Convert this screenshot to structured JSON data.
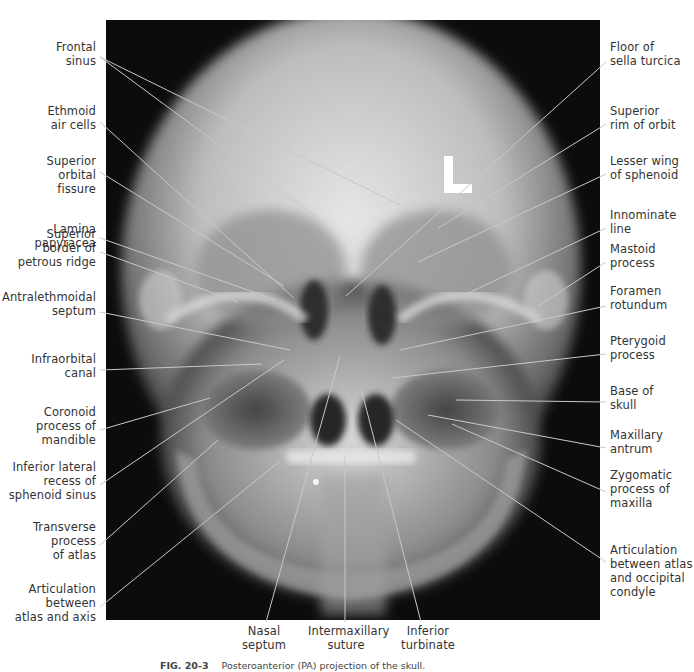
{
  "figure": {
    "modality": "PA radiograph of skull",
    "marker": "L",
    "caption_label": "FIG. 20-3",
    "caption_text": "Posteroanterior (PA) projection of the skull."
  },
  "labels_left": [
    {
      "id": "frontal-sinus",
      "lines": [
        "Frontal",
        "sinus"
      ],
      "top": 40,
      "anchor": [
        100,
        57
      ],
      "target": [
        318,
        218
      ],
      "target2": [
        400,
        205
      ]
    },
    {
      "id": "ethmoid-air-cells",
      "lines": [
        "Ethmoid",
        "air cells"
      ],
      "top": 104,
      "anchor": [
        100,
        122
      ],
      "target": [
        294,
        298
      ]
    },
    {
      "id": "superior-orbital-fissure",
      "lines": [
        "Superior",
        "orbital",
        "fissure"
      ],
      "top": 154,
      "anchor": [
        100,
        172
      ],
      "target": [
        284,
        286
      ]
    },
    {
      "id": "lamina-papyracea",
      "lines": [
        "Lamina",
        "papyracea"
      ],
      "top": 222,
      "anchor": [
        100,
        238
      ],
      "target": [
        276,
        300
      ]
    },
    {
      "id": "superior-border-petrous-ridge",
      "lines": [
        "Superior",
        "border of",
        "petrous ridge"
      ],
      "top": 227,
      "anchor": [
        100,
        252
      ],
      "target": [
        238,
        302
      ]
    },
    {
      "id": "antralethmoidal-septum",
      "lines": [
        "Antralethmoidal",
        "septum"
      ],
      "top": 290,
      "anchor": [
        100,
        312
      ],
      "target": [
        290,
        350
      ]
    },
    {
      "id": "infraorbital-canal",
      "lines": [
        "Infraorbital",
        "canal"
      ],
      "top": 352,
      "anchor": [
        100,
        370
      ],
      "target": [
        262,
        364
      ]
    },
    {
      "id": "coronoid-process-mandible",
      "lines": [
        "Coronoid",
        "process of",
        "mandible"
      ],
      "top": 405,
      "anchor": [
        100,
        430
      ],
      "target": [
        210,
        398
      ]
    },
    {
      "id": "inferior-lateral-recess-sphenoid",
      "lines": [
        "Inferior lateral",
        "recess of",
        "sphenoid sinus"
      ],
      "top": 460,
      "anchor": [
        100,
        485
      ],
      "target": [
        284,
        360
      ]
    },
    {
      "id": "transverse-process-atlas",
      "lines": [
        "Transverse",
        "process",
        "of atlas"
      ],
      "top": 520,
      "anchor": [
        100,
        545
      ],
      "target": [
        218,
        440
      ]
    },
    {
      "id": "articulation-atlas-axis",
      "lines": [
        "Articulation",
        "between",
        "atlas and axis"
      ],
      "top": 582,
      "anchor": [
        100,
        607
      ],
      "target": [
        280,
        461
      ]
    }
  ],
  "labels_right": [
    {
      "id": "floor-sella-turcica",
      "lines": [
        "Floor of",
        "sella turcica"
      ],
      "top": 40,
      "anchor": [
        606,
        62
      ],
      "target": [
        346,
        296
      ]
    },
    {
      "id": "superior-rim-orbit",
      "lines": [
        "Superior",
        "rim of orbit"
      ],
      "top": 104,
      "anchor": [
        606,
        124
      ],
      "target": [
        438,
        228
      ]
    },
    {
      "id": "lesser-wing-sphenoid",
      "lines": [
        "Lesser wing",
        "of sphenoid"
      ],
      "top": 154,
      "anchor": [
        606,
        174
      ],
      "target": [
        418,
        262
      ]
    },
    {
      "id": "innominate-line",
      "lines": [
        "Innominate",
        "line"
      ],
      "top": 208,
      "anchor": [
        606,
        228
      ],
      "target": [
        458,
        298
      ]
    },
    {
      "id": "mastoid-process",
      "lines": [
        "Mastoid",
        "process"
      ],
      "top": 242,
      "anchor": [
        606,
        262
      ],
      "target": [
        538,
        306
      ]
    },
    {
      "id": "foramen-rotundum",
      "lines": [
        "Foramen",
        "rotundum"
      ],
      "top": 284,
      "anchor": [
        606,
        306
      ],
      "target": [
        400,
        350
      ]
    },
    {
      "id": "pterygoid-process",
      "lines": [
        "Pterygoid",
        "process"
      ],
      "top": 334,
      "anchor": [
        606,
        354
      ],
      "target": [
        392,
        378
      ]
    },
    {
      "id": "base-of-skull",
      "lines": [
        "Base of",
        "skull"
      ],
      "top": 384,
      "anchor": [
        606,
        402
      ],
      "target": [
        456,
        400
      ]
    },
    {
      "id": "maxillary-antrum",
      "lines": [
        "Maxillary",
        "antrum"
      ],
      "top": 428,
      "anchor": [
        606,
        448
      ],
      "target": [
        428,
        415
      ]
    },
    {
      "id": "zygomatic-process-maxilla",
      "lines": [
        "Zygomatic",
        "process of",
        "maxilla"
      ],
      "top": 468,
      "anchor": [
        606,
        492
      ],
      "target": [
        452,
        424
      ]
    },
    {
      "id": "articulation-atlas-occipital-condyle",
      "lines": [
        "Articulation",
        "between atlas",
        "and occipital",
        "condyle"
      ],
      "top": 543,
      "anchor": [
        606,
        562
      ],
      "target": [
        396,
        420
      ]
    }
  ],
  "labels_bottom": [
    {
      "id": "nasal-septum",
      "lines": [
        "Nasal",
        "septum"
      ],
      "left": 236,
      "anchor": [
        266,
        622
      ],
      "target": [
        340,
        356
      ]
    },
    {
      "id": "intermaxillary-suture",
      "lines": [
        "Intermaxillary",
        "suture"
      ],
      "left": 308,
      "anchor": [
        345,
        622
      ],
      "target": [
        345,
        455
      ]
    },
    {
      "id": "inferior-turbinate",
      "lines": [
        "Inferior",
        "turbinate"
      ],
      "left": 400,
      "anchor": [
        421,
        622
      ],
      "target": [
        362,
        392
      ]
    }
  ],
  "colors": {
    "leader_line": "#c8c8c8",
    "label_text": "#333333",
    "xray_background": "#0c0c0c"
  }
}
